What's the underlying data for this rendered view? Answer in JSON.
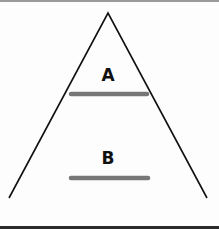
{
  "diagram": {
    "type": "triangle-with-levels",
    "triangle": {
      "apex": [
        108,
        13
      ],
      "bottom_left": [
        9,
        198
      ],
      "bottom_right": [
        207,
        198
      ],
      "stroke": "#111111"
    },
    "levels": [
      {
        "label": "A",
        "label_pos": [
          108,
          81
        ],
        "bar": {
          "x1": 71,
          "x2": 147,
          "y": 94
        }
      },
      {
        "label": "B",
        "label_pos": [
          108,
          164
        ],
        "bar": {
          "x1": 71,
          "x2": 148,
          "y": 178
        }
      }
    ],
    "bar_color": "#777777"
  }
}
